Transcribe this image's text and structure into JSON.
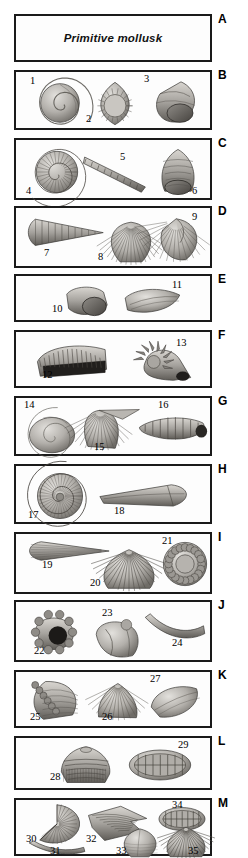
{
  "figure": {
    "title": "Primitive mollusk",
    "background_color": "#ffffff",
    "border_color": "#1a1a1a",
    "width": 248,
    "height": 858,
    "style": "grayscale scientific plate of fossil mollusk shells"
  },
  "panels": [
    {
      "letter": "A",
      "top": 14,
      "height": 48,
      "kind": "title",
      "title": "Primitive mollusk",
      "specimens": []
    },
    {
      "letter": "B",
      "top": 70,
      "height": 60,
      "kind": "specimens",
      "specimens": [
        {
          "number": "1",
          "type": "coiled-gastropod-spiral",
          "x": 22,
          "y": 10,
          "w": 44,
          "h": 42,
          "rot": 0,
          "label_x": 14,
          "label_y": 4
        },
        {
          "number": "2",
          "type": "teardrop-shell-aperture",
          "x": 78,
          "y": 9,
          "w": 42,
          "h": 45,
          "rot": 0,
          "label_x": 70,
          "label_y": 42
        },
        {
          "number": "3",
          "type": "turban-gastropod",
          "x": 134,
          "y": 8,
          "w": 50,
          "h": 46,
          "rot": 0,
          "label_x": 128,
          "label_y": 2
        }
      ]
    },
    {
      "letter": "C",
      "top": 138,
      "height": 62,
      "kind": "specimens",
      "specimens": [
        {
          "number": "4",
          "type": "planispiral-ammonite",
          "x": 18,
          "y": 10,
          "w": 46,
          "h": 44,
          "rot": 0,
          "label_x": 10,
          "label_y": 46
        },
        {
          "number": "5",
          "type": "segmented-rod",
          "x": 66,
          "y": 10,
          "w": 66,
          "h": 44,
          "rot": 0,
          "label_x": 104,
          "label_y": 12
        },
        {
          "number": "6",
          "type": "conical-gastropod-aperture",
          "x": 140,
          "y": 8,
          "w": 44,
          "h": 48,
          "rot": 0,
          "label_x": 176,
          "label_y": 46
        }
      ]
    },
    {
      "letter": "D",
      "top": 206,
      "height": 62,
      "kind": "specimens",
      "specimens": [
        {
          "number": "7",
          "type": "high-spired-cone",
          "x": 10,
          "y": 8,
          "w": 78,
          "h": 32,
          "rot": 0,
          "label_x": 28,
          "label_y": 40
        },
        {
          "number": "8",
          "type": "ribbed-bivalve",
          "x": 90,
          "y": 12,
          "w": 50,
          "h": 44,
          "rot": 0,
          "label_x": 82,
          "label_y": 44
        },
        {
          "number": "9",
          "type": "asymmetric-bivalve-umbo",
          "x": 140,
          "y": 8,
          "w": 48,
          "h": 46,
          "rot": 0,
          "label_x": 176,
          "label_y": 4
        }
      ]
    },
    {
      "letter": "E",
      "top": 274,
      "height": 48,
      "kind": "specimens",
      "specimens": [
        {
          "number": "10",
          "type": "cap-shell-opening",
          "x": 48,
          "y": 8,
          "w": 46,
          "h": 34,
          "rot": 0,
          "label_x": 36,
          "label_y": 28
        },
        {
          "number": "11",
          "type": "elongate-wedge-shell",
          "x": 108,
          "y": 10,
          "w": 58,
          "h": 30,
          "rot": 0,
          "label_x": 156,
          "label_y": 4
        }
      ]
    },
    {
      "letter": "F",
      "top": 330,
      "height": 58,
      "kind": "specimens",
      "specimens": [
        {
          "number": "12",
          "type": "ribbed-chiton-valve",
          "x": 20,
          "y": 10,
          "w": 72,
          "h": 38,
          "rot": 0,
          "label_x": 26,
          "label_y": 38
        },
        {
          "number": "13",
          "type": "spiny-gastropod",
          "x": 110,
          "y": 6,
          "w": 66,
          "h": 46,
          "rot": 0,
          "label_x": 160,
          "label_y": 6
        }
      ]
    },
    {
      "letter": "G",
      "top": 396,
      "height": 60,
      "kind": "specimens",
      "specimens": [
        {
          "number": "14",
          "type": "low-spire-coiled-shell",
          "x": 12,
          "y": 14,
          "w": 48,
          "h": 42,
          "rot": 0,
          "label_x": 8,
          "label_y": 2
        },
        {
          "number": "15",
          "type": "winged-brachiopod",
          "x": 62,
          "y": 8,
          "w": 62,
          "h": 44,
          "rot": 0,
          "label_x": 78,
          "label_y": 44
        },
        {
          "number": "16",
          "type": "turreted-spiral-shell",
          "x": 122,
          "y": 14,
          "w": 72,
          "h": 32,
          "rot": 0,
          "label_x": 142,
          "label_y": 2
        }
      ]
    },
    {
      "letter": "H",
      "top": 464,
      "height": 60,
      "kind": "specimens",
      "specimens": [
        {
          "number": "17",
          "type": "tight-coiled-ammonite",
          "x": 18,
          "y": 6,
          "w": 52,
          "h": 48,
          "rot": 0,
          "label_x": 12,
          "label_y": 44
        },
        {
          "number": "18",
          "type": "elongate-blade-shell",
          "x": 82,
          "y": 16,
          "w": 94,
          "h": 28,
          "rot": 0,
          "label_x": 98,
          "label_y": 40
        }
      ]
    },
    {
      "letter": "I",
      "top": 532,
      "height": 62,
      "kind": "specimens",
      "specimens": [
        {
          "number": "19",
          "type": "pointed-blade-shell",
          "x": 8,
          "y": 6,
          "w": 86,
          "h": 22,
          "rot": 0,
          "label_x": 26,
          "label_y": 26
        },
        {
          "number": "20",
          "type": "fan-scallop",
          "x": 84,
          "y": 14,
          "w": 58,
          "h": 42,
          "rot": 0,
          "label_x": 74,
          "label_y": 44
        },
        {
          "number": "21",
          "type": "rosette-coiled-shell",
          "x": 146,
          "y": 6,
          "w": 46,
          "h": 48,
          "rot": 0,
          "label_x": 146,
          "label_y": 2
        }
      ]
    },
    {
      "letter": "J",
      "top": 600,
      "height": 62,
      "kind": "specimens",
      "specimens": [
        {
          "number": "22",
          "type": "frilled-coral-shell",
          "x": 14,
          "y": 10,
          "w": 48,
          "h": 42,
          "rot": 0,
          "label_x": 18,
          "label_y": 44
        },
        {
          "number": "23",
          "type": "irregular-lumpy-shell",
          "x": 74,
          "y": 14,
          "w": 52,
          "h": 44,
          "rot": 0,
          "label_x": 86,
          "label_y": 6
        },
        {
          "number": "24",
          "type": "curved-tusk-shell",
          "x": 128,
          "y": 10,
          "w": 62,
          "h": 30,
          "rot": 0,
          "label_x": 156,
          "label_y": 36
        }
      ]
    },
    {
      "letter": "K",
      "top": 670,
      "height": 58,
      "kind": "specimens",
      "specimens": [
        {
          "number": "25",
          "type": "knobbed-gastropod",
          "x": 14,
          "y": 6,
          "w": 52,
          "h": 44,
          "rot": 0,
          "label_x": 14,
          "label_y": 40
        },
        {
          "number": "26",
          "type": "triangular-bivalve",
          "x": 78,
          "y": 10,
          "w": 46,
          "h": 38,
          "rot": 0,
          "label_x": 86,
          "label_y": 40
        },
        {
          "number": "27",
          "type": "smooth-oval-bivalve",
          "x": 132,
          "y": 10,
          "w": 54,
          "h": 38,
          "rot": 0,
          "label_x": 134,
          "label_y": 2
        }
      ]
    },
    {
      "letter": "L",
      "top": 736,
      "height": 54,
      "kind": "specimens",
      "specimens": [
        {
          "number": "28",
          "type": "banded-turban-shell",
          "x": 42,
          "y": 8,
          "w": 56,
          "h": 38,
          "rot": 0,
          "label_x": 34,
          "label_y": 34
        },
        {
          "number": "29",
          "type": "ribbed-oval-chiton",
          "x": 112,
          "y": 10,
          "w": 64,
          "h": 34,
          "rot": 0,
          "label_x": 162,
          "label_y": 2
        }
      ]
    },
    {
      "letter": "M",
      "top": 798,
      "height": 58,
      "kind": "specimens",
      "specimens": [
        {
          "number": "30",
          "type": "radial-disc-shell",
          "x": 14,
          "y": 4,
          "w": 54,
          "h": 40,
          "rot": 0,
          "label_x": 10,
          "label_y": 34
        },
        {
          "number": "31",
          "type": "curved-tusk-shell",
          "x": 12,
          "y": 40,
          "w": 58,
          "h": 16,
          "rot": 0,
          "label_x": 34,
          "label_y": 46
        },
        {
          "number": "32",
          "type": "angular-winged-shell",
          "x": 70,
          "y": 4,
          "w": 62,
          "h": 38,
          "rot": 0,
          "label_x": 70,
          "label_y": 34
        },
        {
          "number": "33",
          "type": "oval-smooth-bivalve",
          "x": 102,
          "y": 28,
          "w": 44,
          "h": 30,
          "rot": 0,
          "label_x": 100,
          "label_y": 46
        },
        {
          "number": "34",
          "type": "ribbed-oval-chiton",
          "x": 142,
          "y": 6,
          "w": 48,
          "h": 26,
          "rot": 0,
          "label_x": 156,
          "label_y": 0
        },
        {
          "number": "35",
          "type": "fan-scallop",
          "x": 148,
          "y": 26,
          "w": 44,
          "h": 32,
          "rot": 0,
          "label_x": 172,
          "label_y": 46
        }
      ]
    }
  ]
}
